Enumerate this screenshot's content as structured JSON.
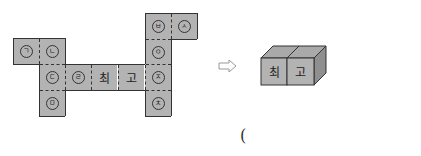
{
  "net": {
    "cells": [
      {
        "label": "ㄱ",
        "x": 13,
        "y": 38,
        "type": "circle"
      },
      {
        "label": "ㄴ",
        "x": 39,
        "y": 38,
        "type": "circle"
      },
      {
        "label": "ㄷ",
        "x": 39,
        "y": 64,
        "type": "circle"
      },
      {
        "label": "ㄹ",
        "x": 65,
        "y": 64,
        "type": "circle"
      },
      {
        "label": "최",
        "x": 91,
        "y": 64,
        "type": "text"
      },
      {
        "label": "고",
        "x": 118,
        "y": 64,
        "type": "text"
      },
      {
        "label": "ㅁ",
        "x": 39,
        "y": 90,
        "type": "circle"
      },
      {
        "label": "ㅂ",
        "x": 145,
        "y": 13,
        "type": "circle"
      },
      {
        "label": "ㅅ",
        "x": 171,
        "y": 13,
        "type": "circle"
      },
      {
        "label": "ㅇ",
        "x": 145,
        "y": 39,
        "type": "circle"
      },
      {
        "label": "ㅈ",
        "x": 145,
        "y": 64,
        "type": "circle"
      },
      {
        "label": "ㅊ",
        "x": 145,
        "y": 90,
        "type": "circle"
      }
    ]
  },
  "arrow": {
    "symbol": "⇨"
  },
  "cubes": {
    "front_left": "최",
    "front_right": "고"
  },
  "answer": {
    "open_paren": "("
  },
  "colors": {
    "face": "#b3b3b3",
    "top": "#a8a8a8",
    "side": "#8f8f8f",
    "line": "#333333"
  }
}
